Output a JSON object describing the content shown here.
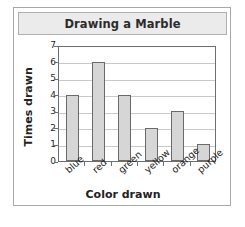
{
  "card": {
    "title": "Drawing a Marble"
  },
  "chart_data": {
    "type": "bar",
    "title": "Drawing a Marble",
    "xlabel": "Color drawn",
    "ylabel": "Times drawn",
    "categories": [
      "blue",
      "red",
      "green",
      "yellow",
      "orange",
      "purple"
    ],
    "values": [
      4,
      6,
      4,
      2,
      3,
      1
    ],
    "ylim": [
      0,
      7
    ],
    "yticks": [
      0,
      1,
      2,
      3,
      4,
      5,
      6,
      7
    ],
    "ytick_labels": [
      "0",
      "1",
      "2",
      "3",
      "4",
      "5",
      "6",
      "7"
    ],
    "grid": true,
    "legend": false,
    "bar_fill_color": "#d6d6d6",
    "bar_border_color": "#6a6a6a",
    "gridline_color": "#c9c9c9",
    "axis_color": "#6e6e6e",
    "title_bar_color": "#ebebeb"
  }
}
